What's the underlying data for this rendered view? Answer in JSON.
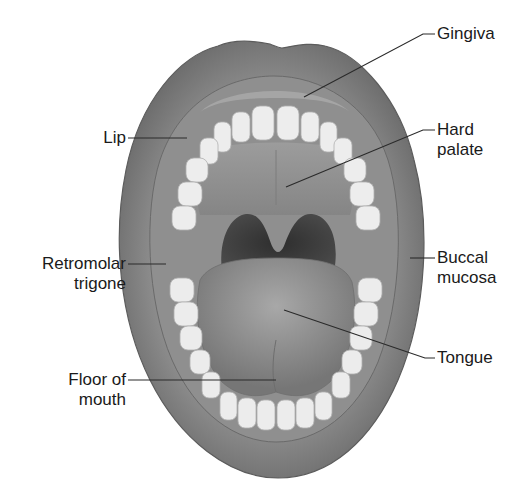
{
  "diagram": {
    "colors": {
      "background": "#ffffff",
      "lip": "#7f7f7f",
      "lip_shadow": "#5e5e5e",
      "gum": "#9a9a9a",
      "teeth": "#ececec",
      "palate": "#8c8c8c",
      "throat": "#3c3c3c",
      "tongue": "#8a8a8a",
      "leader_line": "#2a2a2a",
      "text": "#1a1a1a"
    },
    "labels": {
      "gingiva": {
        "line1": "Gingiva"
      },
      "lip": {
        "line1": "Lip"
      },
      "hard_palate": {
        "line1": "Hard",
        "line2": "palate"
      },
      "retromolar_trigone": {
        "line1": "Retromolar",
        "line2": "trigone"
      },
      "buccal_mucosa": {
        "line1": "Buccal",
        "line2": "mucosa"
      },
      "tongue": {
        "line1": "Tongue"
      },
      "floor_of_mouth": {
        "line1": "Floor of",
        "line2": "mouth"
      }
    }
  }
}
